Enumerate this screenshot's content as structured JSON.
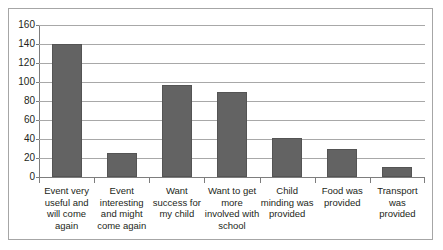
{
  "chart_data": {
    "type": "bar",
    "title": "",
    "subtitle": "",
    "xlabel": "",
    "ylabel": "",
    "categories": [
      "Event very useful and will come again",
      "Event interesting and might come again",
      "Want success for my child",
      "Want to get more involved with school",
      "Child minding was provided",
      "Food was provided",
      "Transport was provided"
    ],
    "values": [
      140,
      25,
      97,
      90,
      41,
      30,
      11
    ],
    "series": [
      {
        "name": "Responses",
        "values": [
          140,
          25,
          97,
          90,
          41,
          30,
          11
        ]
      }
    ],
    "ylim": [
      0,
      160
    ],
    "ytick_step": 20,
    "yticks": [
      160,
      140,
      120,
      100,
      80,
      60,
      40,
      20,
      0
    ],
    "ytick_labels": [
      "160",
      "140",
      "120",
      "100",
      "80",
      "60",
      "40",
      "20",
      "0"
    ],
    "grid": true,
    "grid_axis": "y",
    "legend": false,
    "legend_position": "none",
    "bar_color": "#636363",
    "gridline_color": "#a8a8a8",
    "axis_color": "#7d7d7d",
    "frame_color": "#a6a6a6",
    "text_color": "#231f20"
  }
}
